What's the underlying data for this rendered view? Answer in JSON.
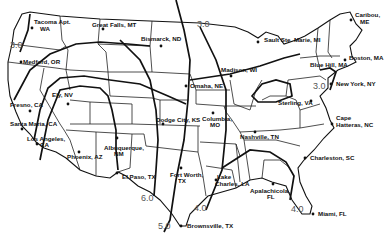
{
  "map": {
    "title": "",
    "isolines": [
      {
        "value": "3.0",
        "label_pos": [
          10,
          48
        ]
      },
      {
        "value": "3.0",
        "label_pos": [
          197,
          27
        ]
      },
      {
        "value": "3.0",
        "label_pos": [
          313,
          89
        ]
      },
      {
        "value": "6.0",
        "label_pos": [
          141,
          201
        ]
      },
      {
        "value": "5.0",
        "label_pos": [
          158,
          229
        ]
      },
      {
        "value": "4.0",
        "label_pos": [
          194,
          211
        ]
      },
      {
        "value": "4.0",
        "label_pos": [
          291,
          212
        ]
      }
    ],
    "cities": [
      {
        "name": "Tacoma Apt.",
        "sub": "WA",
        "x": 32,
        "y": 28
      },
      {
        "name": "Great Falls, MT",
        "sub": "",
        "x": 83,
        "y": 29
      },
      {
        "name": "Bismarck, ND",
        "sub": "",
        "x": 161,
        "y": 46
      },
      {
        "name": "Sault Ste. Marie, MI",
        "sub": "",
        "x": 258,
        "y": 42
      },
      {
        "name": "Caribou,",
        "sub": "ME",
        "x": 351,
        "y": 20
      },
      {
        "name": "Boston, MA",
        "sub": "",
        "x": 345,
        "y": 56
      },
      {
        "name": "Blue Hill, MA",
        "sub": "",
        "x": 315,
        "y": 62
      },
      {
        "name": "New York, NY",
        "sub": "",
        "x": 331,
        "y": 84
      },
      {
        "name": "Medford, OR",
        "sub": "",
        "x": 21,
        "y": 62
      },
      {
        "name": "Ely, NV",
        "sub": "",
        "x": 68,
        "y": 98
      },
      {
        "name": "Fresno, CA",
        "sub": "",
        "x": 30,
        "y": 111
      },
      {
        "name": "Santa Maria, CA",
        "sub": "",
        "x": 22,
        "y": 129
      },
      {
        "name": "Los Angeles,",
        "sub": "CA",
        "x": 37,
        "y": 144
      },
      {
        "name": "Phoenix, AZ",
        "sub": "",
        "x": 79,
        "y": 155
      },
      {
        "name": "Albuquerque,",
        "sub": "NM",
        "x": 117,
        "y": 142
      },
      {
        "name": "El Paso, TX",
        "sub": "",
        "x": 117,
        "y": 172
      },
      {
        "name": "Fort Worth,",
        "sub": "TX",
        "x": 181,
        "y": 168
      },
      {
        "name": "Brownsville, TX",
        "sub": "",
        "x": 181,
        "y": 225
      },
      {
        "name": "Omaha, NE",
        "sub": "",
        "x": 186,
        "y": 86
      },
      {
        "name": "Madison, WI",
        "sub": "",
        "x": 231,
        "y": 72
      },
      {
        "name": "Dodge City, KS",
        "sub": "",
        "x": 165,
        "y": 121
      },
      {
        "name": "Columbia,",
        "sub": "MO",
        "x": 213,
        "y": 112
      },
      {
        "name": "Nashville, TN",
        "sub": "",
        "x": 255,
        "y": 133
      },
      {
        "name": "Sterling, VA",
        "sub": "",
        "x": 311,
        "y": 102
      },
      {
        "name": "Cape",
        "sub": "Hatteras, NC",
        "x": 332,
        "y": 124
      },
      {
        "name": "Charleston, SC",
        "sub": "",
        "x": 305,
        "y": 158
      },
      {
        "name": "Lake",
        "sub": "Charles, LA",
        "x": 216,
        "y": 180
      },
      {
        "name": "Apalachicola,",
        "sub": "FL",
        "x": 273,
        "y": 184
      },
      {
        "name": "Miami, FL",
        "sub": "",
        "x": 313,
        "y": 214
      }
    ]
  }
}
